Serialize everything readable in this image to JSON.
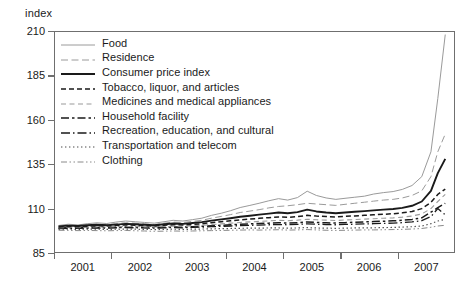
{
  "axis": {
    "y_title": "index",
    "y_ticks": [
      210,
      185,
      160,
      135,
      110,
      85
    ],
    "x_ticks": [
      "2001",
      "2002",
      "2003",
      "2004",
      "2005",
      "2006",
      "2007"
    ]
  },
  "legend": {
    "items": [
      {
        "label": "Food",
        "style": "solid-light",
        "color": "#9a9a9a"
      },
      {
        "label": "Residence",
        "style": "dashed-light",
        "color": "#9a9a9a"
      },
      {
        "label": "Consumer price index",
        "style": "solid-bold",
        "color": "#1a1a1a"
      },
      {
        "label": "Tobacco, liquor, and articles",
        "style": "dashed-bold",
        "color": "#1a1a1a"
      },
      {
        "label": "Medicines and medical appliances",
        "style": "dashed-gray",
        "color": "#9a9a9a"
      },
      {
        "label": "Household facility",
        "style": "dash-dot-bold",
        "color": "#1a1a1a"
      },
      {
        "label": "Recreation, education, and cultural",
        "style": "dash-dot-long",
        "color": "#1a1a1a"
      },
      {
        "label": "Transportation and telecom",
        "style": "dotted",
        "color": "#4a4a4a"
      },
      {
        "label": "Clothing",
        "style": "dash-dot-dot",
        "color": "#8a8a8a"
      }
    ]
  },
  "chart_data": {
    "type": "line",
    "title": "",
    "xlabel": "",
    "ylabel": "index",
    "ylim": [
      85,
      210
    ],
    "xlim": [
      2000.5,
      2007.5
    ],
    "grid": false,
    "legend_position": "inside-top-left",
    "x": [
      2000.58,
      2000.75,
      2000.92,
      2001.08,
      2001.25,
      2001.42,
      2001.58,
      2001.75,
      2001.92,
      2002.08,
      2002.25,
      2002.42,
      2002.58,
      2002.75,
      2002.92,
      2003.08,
      2003.25,
      2003.42,
      2003.58,
      2003.75,
      2003.92,
      2004.08,
      2004.25,
      2004.42,
      2004.58,
      2004.75,
      2004.92,
      2005.08,
      2005.25,
      2005.42,
      2005.58,
      2005.75,
      2005.92,
      2006.08,
      2006.25,
      2006.42,
      2006.58,
      2006.75,
      2006.92,
      2007.08,
      2007.2,
      2007.33
    ],
    "series": [
      {
        "name": "Food",
        "style": "solid-light",
        "color": "#9a9a9a",
        "values": [
          100.5,
          101.2,
          100.8,
          101.5,
          102.0,
          101.6,
          102.4,
          103.0,
          102.6,
          102.2,
          101.8,
          102.6,
          103.4,
          103.0,
          103.8,
          104.6,
          106.2,
          107.4,
          108.8,
          110.6,
          111.8,
          113.0,
          114.4,
          115.6,
          114.8,
          116.2,
          119.8,
          117.4,
          116.0,
          115.2,
          115.8,
          116.4,
          117.0,
          118.2,
          119.0,
          119.6,
          120.8,
          123.0,
          128.0,
          142.0,
          172.0,
          208.0
        ]
      },
      {
        "name": "Residence",
        "style": "dashed-light",
        "color": "#9a9a9a",
        "values": [
          100.2,
          100.6,
          100.4,
          100.8,
          101.2,
          101.0,
          101.6,
          102.0,
          101.8,
          101.4,
          101.0,
          101.8,
          102.4,
          102.2,
          102.8,
          103.4,
          104.6,
          105.6,
          106.6,
          107.8,
          108.6,
          109.4,
          110.4,
          111.2,
          111.6,
          112.2,
          113.0,
          112.6,
          112.2,
          111.8,
          112.4,
          113.0,
          113.6,
          114.2,
          114.8,
          115.2,
          116.0,
          117.4,
          120.0,
          128.0,
          142.0,
          152.0
        ]
      },
      {
        "name": "Consumer price index",
        "style": "solid-bold",
        "color": "#1a1a1a",
        "values": [
          100.0,
          100.4,
          100.2,
          100.6,
          100.9,
          100.7,
          101.0,
          101.4,
          101.2,
          100.9,
          100.6,
          101.2,
          101.6,
          101.4,
          101.9,
          102.4,
          103.2,
          103.9,
          104.6,
          105.4,
          106.0,
          106.6,
          107.2,
          107.8,
          107.4,
          108.0,
          109.4,
          108.4,
          107.8,
          107.4,
          107.8,
          108.2,
          108.6,
          109.0,
          109.4,
          109.8,
          110.4,
          111.6,
          114.0,
          120.0,
          130.0,
          138.0
        ]
      },
      {
        "name": "Tobacco, liquor, and articles",
        "style": "dashed-bold",
        "color": "#1a1a1a",
        "values": [
          99.6,
          99.9,
          99.8,
          100.1,
          100.3,
          100.2,
          100.5,
          100.8,
          100.6,
          100.4,
          100.2,
          100.6,
          100.9,
          100.8,
          101.1,
          101.5,
          102.1,
          102.6,
          103.1,
          103.7,
          104.1,
          104.5,
          104.9,
          105.3,
          105.1,
          105.5,
          106.2,
          105.8,
          105.5,
          105.3,
          105.6,
          105.9,
          106.2,
          106.5,
          106.8,
          107.1,
          107.6,
          108.4,
          110.0,
          113.5,
          118.0,
          121.0
        ]
      },
      {
        "name": "Medicines and medical appliances",
        "style": "dashed-gray",
        "color": "#9a9a9a",
        "values": [
          99.2,
          99.4,
          99.3,
          99.5,
          99.7,
          99.6,
          99.8,
          100.0,
          99.9,
          99.7,
          99.6,
          99.9,
          100.1,
          100.0,
          100.3,
          100.6,
          101.0,
          101.4,
          101.8,
          102.2,
          102.5,
          102.8,
          103.1,
          103.4,
          103.2,
          103.5,
          104.0,
          103.7,
          103.5,
          103.3,
          103.6,
          103.8,
          104.1,
          104.3,
          104.6,
          104.8,
          105.2,
          105.8,
          107.0,
          110.0,
          114.0,
          118.0
        ]
      },
      {
        "name": "Household facility",
        "style": "dash-dot-bold",
        "color": "#1a1a1a",
        "values": [
          99.0,
          99.2,
          99.1,
          99.3,
          99.4,
          99.3,
          99.5,
          99.7,
          99.6,
          99.4,
          99.3,
          99.5,
          99.7,
          99.6,
          99.8,
          100.0,
          100.3,
          100.6,
          100.9,
          101.2,
          101.4,
          101.6,
          101.8,
          102.0,
          101.9,
          102.1,
          102.5,
          102.2,
          102.0,
          101.9,
          102.1,
          102.3,
          102.5,
          102.7,
          102.9,
          103.1,
          103.4,
          103.9,
          104.8,
          108.0,
          110.5,
          113.0
        ]
      },
      {
        "name": "Recreation, education, and cultural",
        "style": "dash-dot-long",
        "color": "#1a1a1a",
        "values": [
          98.8,
          98.9,
          98.9,
          99.0,
          99.1,
          99.0,
          99.2,
          99.3,
          99.2,
          99.1,
          99.0,
          99.2,
          99.3,
          99.2,
          99.4,
          99.6,
          99.8,
          100.0,
          100.2,
          100.4,
          100.6,
          100.7,
          100.9,
          101.0,
          100.9,
          101.1,
          101.4,
          101.2,
          101.0,
          100.9,
          101.1,
          101.2,
          101.4,
          101.5,
          101.7,
          101.8,
          102.1,
          102.5,
          103.2,
          105.5,
          110.0,
          106.5
        ]
      },
      {
        "name": "Transportation and telecom",
        "style": "dotted",
        "color": "#4a4a4a",
        "values": [
          98.4,
          98.4,
          98.3,
          98.4,
          98.4,
          98.3,
          98.4,
          98.5,
          98.4,
          98.3,
          98.2,
          98.3,
          98.4,
          98.3,
          98.4,
          98.5,
          98.6,
          98.7,
          98.8,
          98.9,
          99.0,
          99.0,
          99.1,
          99.1,
          99.0,
          99.1,
          99.3,
          99.1,
          99.0,
          98.9,
          99.0,
          99.1,
          99.2,
          99.2,
          99.3,
          99.4,
          99.6,
          99.8,
          100.2,
          101.5,
          103.0,
          104.0
        ]
      },
      {
        "name": "Clothing",
        "style": "dash-dot-dot",
        "color": "#8a8a8a",
        "values": [
          97.8,
          97.7,
          97.6,
          97.7,
          97.6,
          97.5,
          97.6,
          97.7,
          97.5,
          97.4,
          97.2,
          97.3,
          97.4,
          97.3,
          97.4,
          97.5,
          97.6,
          97.7,
          97.8,
          97.9,
          98.0,
          97.9,
          98.0,
          98.1,
          97.9,
          98.0,
          98.2,
          98.0,
          97.8,
          97.7,
          97.8,
          97.9,
          98.0,
          98.0,
          98.1,
          98.2,
          98.3,
          98.5,
          98.8,
          99.5,
          100.2,
          100.6
        ]
      }
    ]
  }
}
